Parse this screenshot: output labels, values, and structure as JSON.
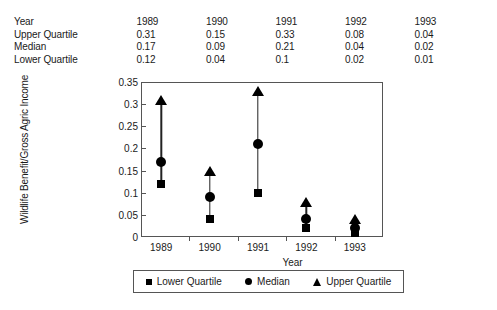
{
  "table": {
    "rows": [
      {
        "label": "Year",
        "values": [
          "1989",
          "1990",
          "1991",
          "1992",
          "1993"
        ]
      },
      {
        "label": "Upper Quartile",
        "values": [
          "0.31",
          "0.15",
          "0.33",
          "0.08",
          "0.04"
        ]
      },
      {
        "label": "Median",
        "values": [
          "0.17",
          "0.09",
          "0.21",
          "0.04",
          "0.02"
        ]
      },
      {
        "label": "Lower Quartile",
        "values": [
          "0.12",
          "0.04",
          "0.1",
          "0.02",
          "0.01"
        ]
      }
    ]
  },
  "chart_data": {
    "type": "scatter",
    "title": "",
    "xlabel": "Year",
    "ylabel": "Wildlife Benefit/Gross Agric Income",
    "categories": [
      "1989",
      "1990",
      "1991",
      "1992",
      "1993"
    ],
    "x": [
      1989,
      1990,
      1991,
      1992,
      1993
    ],
    "series": [
      {
        "name": "Lower Quartile",
        "marker": "square",
        "values": [
          0.12,
          0.04,
          0.1,
          0.02,
          0.01
        ]
      },
      {
        "name": "Median",
        "marker": "circle",
        "values": [
          0.17,
          0.09,
          0.21,
          0.04,
          0.02
        ]
      },
      {
        "name": "Upper Quartile",
        "marker": "triangle",
        "values": [
          0.31,
          0.15,
          0.33,
          0.08,
          0.04
        ]
      }
    ],
    "ylim": [
      0,
      0.35
    ],
    "yticks": [
      0,
      0.05,
      0.1,
      0.15,
      0.2,
      0.25,
      0.3,
      0.35
    ],
    "ytick_labels": [
      "0",
      "0.05",
      "0.1",
      "0.15",
      "0.2",
      "0.25",
      "0.3",
      "0.35"
    ],
    "grid": false,
    "legend_position": "bottom",
    "connector": "vertical line from lower quartile to upper quartile"
  },
  "legend": {
    "items": [
      {
        "label": "Lower Quartile",
        "marker": "square-marker-icon"
      },
      {
        "label": "Median",
        "marker": "circle-marker-icon"
      },
      {
        "label": "Upper Quartile",
        "marker": "triangle-marker-icon"
      }
    ]
  },
  "colors": {
    "marker": "#000000",
    "axis": "#555555",
    "text": "#1a1a1a",
    "background": "#ffffff"
  }
}
